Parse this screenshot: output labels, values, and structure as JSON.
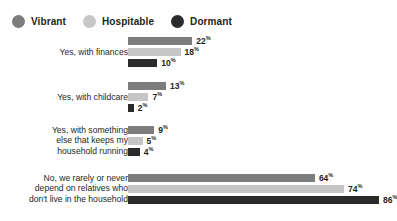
{
  "legend": {
    "position": "top-left",
    "items": [
      {
        "label": "Vibrant",
        "color": "#7d7d7d",
        "icon": "circle-icon"
      },
      {
        "label": "Hospitable",
        "color": "#c6c6c6",
        "icon": "circle-icon"
      },
      {
        "label": "Dormant",
        "color": "#2b2b2b",
        "icon": "circle-icon"
      }
    ]
  },
  "chart_data": {
    "type": "bar",
    "orientation": "horizontal",
    "title": "",
    "subtitle": "",
    "xlabel": "",
    "ylabel": "",
    "xlim": [
      0,
      100
    ],
    "grid": false,
    "value_suffix": "%",
    "legend_position": "top-left",
    "categories": [
      "Yes, with finances",
      "Yes, with childcare",
      "Yes, with something\nelse that keeps my\nhousehold running",
      "No, we rarely or never\ndepend on relatives who\ndon't live in the household"
    ],
    "series": [
      {
        "name": "Vibrant",
        "color": "#7d7d7d",
        "values": [
          22,
          13,
          9,
          64
        ]
      },
      {
        "name": "Hospitable",
        "color": "#c6c6c6",
        "values": [
          18,
          7,
          5,
          74
        ]
      },
      {
        "name": "Dormant",
        "color": "#2b2b2b",
        "values": [
          10,
          2,
          4,
          86
        ]
      }
    ],
    "value_labels": [
      [
        "22%",
        "18%",
        "10%"
      ],
      [
        "13%",
        "7%",
        "2%"
      ],
      [
        "9%",
        "5%",
        "4%"
      ],
      [
        "64%",
        "74%",
        "86%"
      ]
    ]
  },
  "layout": {
    "bar_origin_x": 128,
    "px_per_percent": 2.92,
    "group_tops": [
      4,
      49,
      93,
      141
    ],
    "bar_height": 8,
    "bar_gap": 3
  }
}
